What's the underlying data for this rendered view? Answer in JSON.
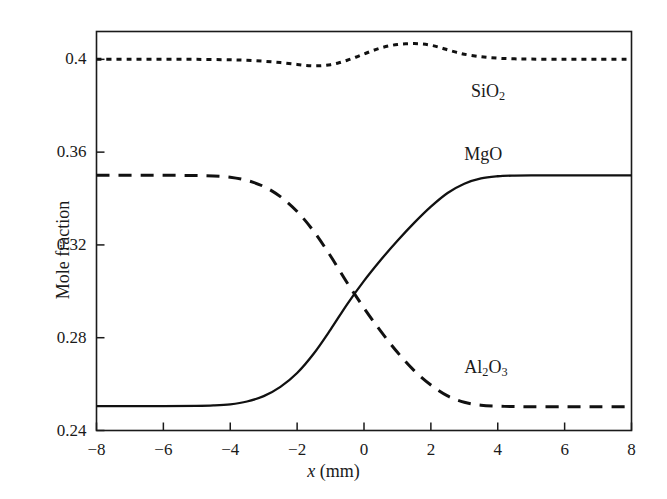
{
  "chart_data": {
    "type": "line",
    "title": "",
    "subtitle": "",
    "xlabel": "x (mm)",
    "ylabel": "Mole fraction",
    "xlim": [
      -8,
      8
    ],
    "ylim": [
      0.24,
      0.412
    ],
    "grid": false,
    "legend": "inline-annotations",
    "xticks": [
      -8,
      -6,
      -4,
      -2,
      0,
      2,
      4,
      6,
      8
    ],
    "xtick_labels": [
      "−8",
      "−6",
      "−4",
      "−2",
      "0",
      "2",
      "4",
      "6",
      "8"
    ],
    "yticks": [
      0.24,
      0.28,
      0.32,
      0.36,
      0.4
    ],
    "ytick_labels": [
      "0.24",
      "0.28",
      "0.32",
      "0.36",
      "0.4"
    ],
    "series": [
      {
        "name": "SiO2",
        "label_html": "SiO<sub>2</sub>",
        "style": "dotted",
        "label_x": 3.2,
        "label_y": 0.3855,
        "x": [
          -8.0,
          -7.0,
          -6.0,
          -5.0,
          -4.0,
          -3.5,
          -3.0,
          -2.5,
          -2.0,
          -1.75,
          -1.5,
          -1.25,
          -1.0,
          -0.75,
          -0.5,
          -0.25,
          0.0,
          0.25,
          0.5,
          0.75,
          1.0,
          1.25,
          1.5,
          1.75,
          2.0,
          2.25,
          2.5,
          2.75,
          3.0,
          3.5,
          4.0,
          4.5,
          5.0,
          6.0,
          7.0,
          8.0
        ],
        "y": [
          0.4,
          0.4,
          0.4,
          0.4,
          0.3998,
          0.3996,
          0.3992,
          0.3986,
          0.3978,
          0.3974,
          0.3972,
          0.3973,
          0.3977,
          0.3985,
          0.3996,
          0.4009,
          0.4023,
          0.4037,
          0.4049,
          0.4058,
          0.4064,
          0.4067,
          0.4068,
          0.4066,
          0.4061,
          0.4052,
          0.4041,
          0.4031,
          0.4022,
          0.4011,
          0.4005,
          0.4002,
          0.4001,
          0.4,
          0.4,
          0.4
        ]
      },
      {
        "name": "MgO",
        "label_html": "MgO",
        "style": "solid",
        "label_x": 3.0,
        "label_y": 0.3585,
        "x": [
          -8.0,
          -6.0,
          -5.0,
          -4.5,
          -4.0,
          -3.5,
          -3.0,
          -2.5,
          -2.0,
          -1.5,
          -1.0,
          -0.5,
          0.0,
          0.5,
          1.0,
          1.5,
          2.0,
          2.5,
          3.0,
          3.5,
          4.0,
          4.5,
          5.0,
          6.0,
          7.0,
          8.0
        ],
        "y": [
          0.2505,
          0.2505,
          0.2506,
          0.2508,
          0.2513,
          0.2525,
          0.2548,
          0.2588,
          0.2648,
          0.2732,
          0.2835,
          0.2945,
          0.3045,
          0.3135,
          0.3218,
          0.3295,
          0.3365,
          0.3424,
          0.3464,
          0.3487,
          0.3496,
          0.3499,
          0.35,
          0.35,
          0.35,
          0.35
        ]
      },
      {
        "name": "Al2O3",
        "label_html": "Al<sub>2</sub>O<sub>3</sub>",
        "style": "dashed",
        "label_x": 3.0,
        "label_y": 0.2665,
        "x": [
          -8.0,
          -6.0,
          -5.0,
          -4.5,
          -4.0,
          -3.5,
          -3.0,
          -2.5,
          -2.0,
          -1.5,
          -1.0,
          -0.5,
          0.0,
          0.5,
          1.0,
          1.5,
          2.0,
          2.5,
          3.0,
          3.5,
          4.0,
          4.5,
          5.0,
          6.0,
          7.0,
          8.0
        ],
        "y": [
          0.35,
          0.35,
          0.3499,
          0.3497,
          0.3492,
          0.3478,
          0.3452,
          0.3408,
          0.3344,
          0.3258,
          0.3152,
          0.3036,
          0.2928,
          0.2828,
          0.2737,
          0.2658,
          0.2596,
          0.2549,
          0.2522,
          0.2509,
          0.2505,
          0.2503,
          0.2502,
          0.2502,
          0.2502,
          0.2502
        ]
      }
    ]
  },
  "axis": {
    "line_color": "#1a1a1a",
    "series_color": "#111111"
  }
}
